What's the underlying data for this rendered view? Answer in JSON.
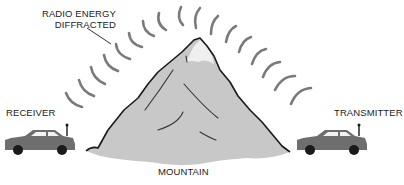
{
  "diagram": {
    "labels": {
      "radio_energy_line1": "RADIO ENERGY",
      "radio_energy_line2": "DIFFRACTED",
      "receiver": "RECEIVER",
      "transmitter": "TRANSMITTER",
      "mountain": "MOUNTAIN"
    },
    "elements": [
      {
        "id": "receiver-car",
        "type": "car-with-antenna",
        "role": "receiver"
      },
      {
        "id": "transmitter-car",
        "type": "car-with-antenna",
        "role": "transmitter"
      },
      {
        "id": "mountain",
        "type": "mountain"
      },
      {
        "id": "diffracted-waves",
        "type": "arc-wavefronts",
        "count": 16
      }
    ],
    "colors": {
      "mountain_fill": "#c8c8c8",
      "mountain_outline": "#1a1a1a",
      "car_body": "#6e6e6e",
      "car_window": "#f2f2f2",
      "wheel": "#1a1a1a",
      "wave": "#7a7a7a",
      "text": "#222222"
    }
  }
}
